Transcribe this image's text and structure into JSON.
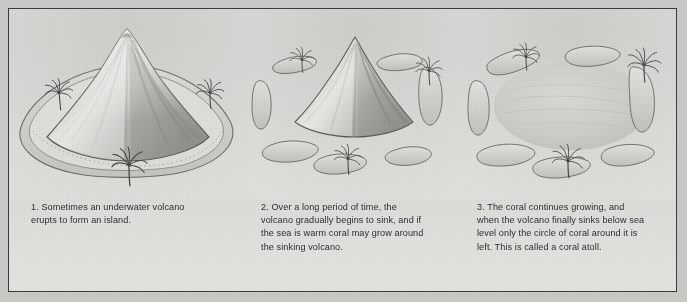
{
  "figure": {
    "background_color": "#d6d6d3",
    "frame_color": "#3a3a3a",
    "style": "pencil illustration"
  },
  "panels": [
    {
      "number": "1",
      "name": "volcano-island",
      "caption": "1. Sometimes an underwater volcano\nerupts to form an island.",
      "scene_label": "large volcanic island with surrounding reef",
      "palm_count": 3
    },
    {
      "number": "2",
      "name": "sinking-volcano-with-coral",
      "caption": "2. Over a long period of time, the\nvolcano gradually begins to sink, and if\nthe sea is warm coral may grow around\nthe sinking volcano.",
      "scene_label": "smaller volcano ringed by coral islets",
      "palm_count": 3,
      "islet_count": 8
    },
    {
      "number": "3",
      "name": "coral-atoll",
      "caption": "3. The coral continues growing, and\nwhen the volcano finally sinks below sea\nlevel only the circle of coral around it is\nleft. This is called a coral atoll.",
      "scene_label": "ring of coral islets around a lagoon",
      "palm_count": 3,
      "islet_count": 8
    }
  ],
  "colors": {
    "paper": "#dcdcd9",
    "ink": "#2e2e30",
    "cone_light": "#d8d8d4",
    "cone_shadow": "#8f8f8c",
    "reef": "#cfcfca",
    "lagoon": "#d2d2ce",
    "palm": "#4a4a48"
  }
}
